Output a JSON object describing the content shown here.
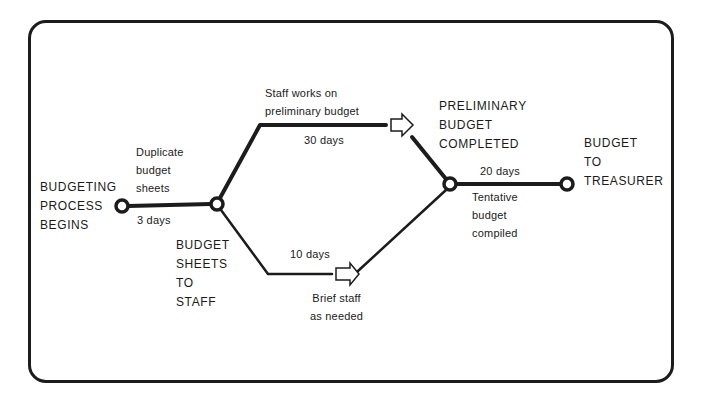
{
  "diagram": {
    "type": "pert-network",
    "nodes": [
      {
        "id": "start",
        "label_lines": [
          "BUDGETING",
          "PROCESS",
          "BEGINS"
        ]
      },
      {
        "id": "sheets",
        "label_lines": [
          "BUDGET",
          "SHEETS",
          "TO",
          "STAFF"
        ]
      },
      {
        "id": "prelim",
        "label_lines": [
          "PRELIMINARY",
          "BUDGET",
          "COMPLETED"
        ]
      },
      {
        "id": "treasurer",
        "label_lines": [
          "BUDGET",
          "TO",
          "TREASURER"
        ]
      }
    ],
    "activities": [
      {
        "from": "start",
        "to": "sheets",
        "description_lines": [
          "Duplicate",
          "budget",
          "sheets"
        ],
        "duration": "3 days"
      },
      {
        "from": "sheets",
        "to": "prelim",
        "description_lines": [
          "Staff works on",
          "preliminary budget"
        ],
        "duration": "30 days"
      },
      {
        "from": "sheets",
        "to": "prelim",
        "description_lines": [
          "Brief staff",
          "as needed"
        ],
        "duration": "10 days"
      },
      {
        "from": "prelim",
        "to": "treasurer",
        "description_lines": [
          "Tentative",
          "budget",
          "compiled"
        ],
        "duration": "20 days"
      }
    ]
  },
  "colors": {
    "line": "#1c1c1c",
    "background": "#ffffff"
  }
}
